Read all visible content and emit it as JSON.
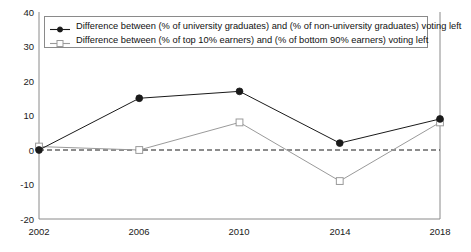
{
  "chart_data": {
    "type": "line",
    "title": "",
    "subtitle": "",
    "xlabel": "",
    "ylabel": "",
    "x": [
      2002,
      2006,
      2010,
      2014,
      2018
    ],
    "categories": [
      "2002",
      "2006",
      "2010",
      "2014",
      "2018"
    ],
    "xlim": [
      2002,
      2018
    ],
    "ylim": [
      -20,
      40
    ],
    "yticks": [
      40,
      30,
      20,
      10,
      0,
      -10,
      -20
    ],
    "ytick_labels": [
      "40",
      "30",
      "20",
      "10",
      "0",
      "-10",
      "-20"
    ],
    "xticks": [
      2002,
      2006,
      2010,
      2014,
      2018
    ],
    "xtick_labels": [
      "2002",
      "2006",
      "2010",
      "2014",
      "2018"
    ],
    "grid": false,
    "zero_line": 0,
    "legend_position": "top-left",
    "series": [
      {
        "name": "Difference between (% of university graduates) and (% of non-university graduates) voting left",
        "values": [
          0,
          15,
          17,
          2,
          9
        ],
        "color": "#1a1a1a",
        "marker": "filled-circle"
      },
      {
        "name": "Difference between (% of top 10% earners) and (% of bottom 90% earners) voting left",
        "values": [
          1,
          0,
          8,
          -9,
          8
        ],
        "color": "#9a9a9a",
        "marker": "open-square"
      }
    ]
  },
  "legend": {
    "items": [
      {
        "label": "Difference between (% of university graduates) and (% of non-university graduates) voting left"
      },
      {
        "label": "Difference between (% of top 10% earners) and (% of bottom 90% earners) voting left"
      }
    ]
  },
  "axes": {
    "y_tick_labels": [
      "40",
      "30",
      "20",
      "10",
      "0",
      "-10",
      "-20"
    ],
    "x_tick_labels": [
      "2002",
      "2006",
      "2010",
      "2014",
      "2018"
    ]
  },
  "colors": {
    "series_one": "#1a1a1a",
    "series_two": "#9a9a9a",
    "axis": "#8a8a8a",
    "zero_line": "#1a1a1a",
    "background": "#ffffff"
  }
}
